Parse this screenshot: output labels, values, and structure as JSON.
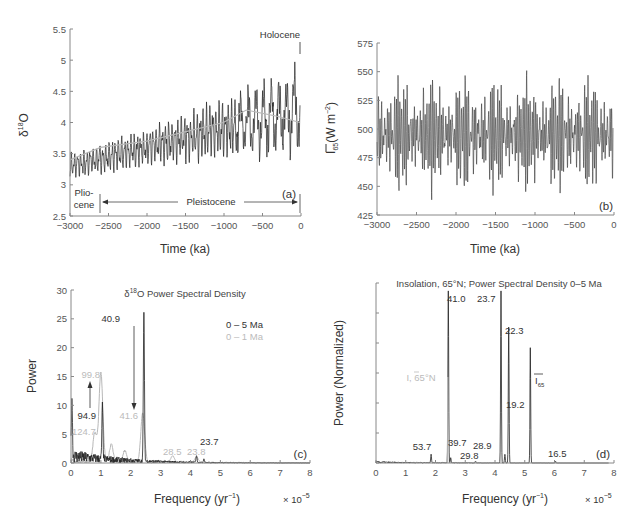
{
  "colors": {
    "dark": "#222222",
    "grey": "#b8b8b8",
    "axis": "#777777"
  },
  "chart_data": [
    {
      "panel": "(a)",
      "type": "line",
      "title": "",
      "xlabel": "Time (ka)",
      "ylabel": "δ18O",
      "xlim": [
        -3000,
        0
      ],
      "ylim": [
        2.5,
        5.5
      ],
      "xticks": [
        "-3000",
        "-2500",
        "-2000",
        "-1500",
        "-1000",
        "-500",
        "0"
      ],
      "yticks": [
        "2.5",
        "3",
        "3.5",
        "4",
        "4.5",
        "5",
        "5.5"
      ],
      "series": [
        {
          "name": "δ18O record",
          "color": "dark",
          "trend_start": 3.3,
          "trend_end": 4.2,
          "amplitude_start": 0.25,
          "amplitude_end": 0.85
        },
        {
          "name": "smoothed mean",
          "color": "grey",
          "x": [
            -3000,
            -2600,
            -2000,
            -1500,
            -1000,
            -700,
            -300,
            0
          ],
          "y": [
            3.4,
            3.6,
            3.7,
            3.85,
            4.0,
            4.2,
            4.1,
            4.0
          ]
        }
      ],
      "annotations": {
        "holocene": "Holocene",
        "pliocene_line1": "Plio-",
        "pliocene_line2": "cene",
        "pleistocene": "Pleistocene",
        "panel_label": "(a)"
      }
    },
    {
      "panel": "(b)",
      "type": "line",
      "xlabel": "Time (ka)",
      "ylabel": "I65(W m-2)",
      "xlim": [
        -3000,
        0
      ],
      "ylim": [
        425,
        575
      ],
      "xticks": [
        "-3000",
        "-2500",
        "-2000",
        "-1500",
        "-1000",
        "-500",
        "0"
      ],
      "yticks": [
        "425",
        "450",
        "475",
        "500",
        "525",
        "550",
        "575"
      ],
      "series": [
        {
          "name": "Insolation 65°N",
          "color": "dark",
          "mean": 495,
          "amplitude": 35,
          "min": 433,
          "max": 568
        }
      ],
      "annotations": {
        "panel_label": "(b)"
      }
    },
    {
      "panel": "(c)",
      "type": "line",
      "title": "δ18O Power Spectral Density",
      "xlabel": "Frequency (yr-1)",
      "xscale_label": "× 10-5",
      "ylabel": "Power",
      "xlim": [
        0,
        8
      ],
      "ylim": [
        0,
        30
      ],
      "xticks": [
        "0",
        "1",
        "2",
        "3",
        "4",
        "5",
        "6",
        "7",
        "8"
      ],
      "yticks": [
        "0",
        "5",
        "10",
        "15",
        "20",
        "25",
        "30"
      ],
      "legend": [
        {
          "label": "0 – 5 Ma",
          "color": "dark"
        },
        {
          "label": "0 – 1 Ma",
          "color": "grey"
        }
      ],
      "series": [
        {
          "name": "0 – 5 Ma",
          "color": "dark",
          "peaks": [
            {
              "f": 0.03,
              "p": 10
            },
            {
              "f": 1.05,
              "p": 9.3
            },
            {
              "f": 2.44,
              "p": 26
            },
            {
              "f": 4.2,
              "p": 1.2
            },
            {
              "f": 4.45,
              "p": 0.6
            }
          ]
        },
        {
          "name": "0 – 1 Ma",
          "color": "grey",
          "peaks": [
            {
              "f": 0.8,
              "p": 5
            },
            {
              "f": 1.0,
              "p": 15.5
            },
            {
              "f": 1.35,
              "p": 3
            },
            {
              "f": 1.8,
              "p": 2
            },
            {
              "f": 2.4,
              "p": 8.5
            },
            {
              "f": 3.4,
              "p": 1.2
            },
            {
              "f": 4.2,
              "p": 1.0
            }
          ]
        }
      ],
      "annotations": {
        "p_40_9": "40.9",
        "p_41_6": "41.6",
        "p_99_8": "99.8",
        "p_94_9": "94.9",
        "p_124_7": "124.7",
        "p_28_5": "28.5",
        "p_23_8": "23.8",
        "p_23_7": "23.7",
        "panel_label": "(c)"
      }
    },
    {
      "panel": "(d)",
      "type": "line",
      "title": "Insolation, 65°N; Power Spectral Density 0–5 Ma",
      "xlabel": "Frequency (yr-1)",
      "xscale_label": "× 10-5",
      "ylabel": "Power (Normalized)",
      "xlim": [
        0,
        8
      ],
      "ylim": [
        0,
        1
      ],
      "xticks": [
        "0",
        "1",
        "2",
        "3",
        "4",
        "5",
        "6",
        "7",
        "8"
      ],
      "yticks": [],
      "series": [
        {
          "name": "I, 65°N",
          "color": "dark",
          "peaks": [
            {
              "f": 1.86,
              "p": 0.05
            },
            {
              "f": 2.44,
              "p": 1.0
            },
            {
              "f": 2.52,
              "p": 0.03
            },
            {
              "f": 3.36,
              "p": 0.01
            },
            {
              "f": 4.22,
              "p": 1.0
            },
            {
              "f": 4.35,
              "p": 0.05
            },
            {
              "f": 4.48,
              "p": 0.79
            },
            {
              "f": 5.21,
              "p": 0.67
            },
            {
              "f": 6.06,
              "p": 0.01
            }
          ]
        }
      ],
      "annotations": {
        "p_41_0": "41.0",
        "p_23_7": "23.7",
        "p_22_3": "22.3",
        "p_19_2": "19.2",
        "p_53_7": "53.7",
        "p_39_7": "39.7",
        "p_29_8": "29.8",
        "p_28_9": "28.9",
        "p_16_5": "16.5",
        "legend_i65": "I, 65°N",
        "label_i65": "I65",
        "panel_label": "(d)"
      }
    }
  ]
}
